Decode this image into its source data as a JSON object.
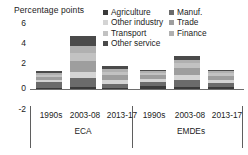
{
  "chart_data": {
    "type": "bar",
    "stacked": true,
    "title": "",
    "ylabel": "Percentage points",
    "xlabel": "",
    "ylim": [
      -2,
      6
    ],
    "yticks": [
      "6",
      "4",
      "2",
      "0",
      "-2"
    ],
    "ytick_values": [
      6,
      4,
      2,
      0,
      -2
    ],
    "grid": false,
    "legend_position": "top-right",
    "groups": [
      "ECA",
      "EMDEs"
    ],
    "categories": [
      "1990s",
      "2003-08",
      "2013-17",
      "1990s",
      "2003-08",
      "2013-17"
    ],
    "category_groups": [
      "ECA",
      "ECA",
      "ECA",
      "EMDEs",
      "EMDEs",
      "EMDEs"
    ],
    "series": [
      {
        "name": "Agriculture",
        "color": "#3a3a3a",
        "values": [
          0.12,
          0.18,
          0.1,
          0.22,
          0.2,
          0.16
        ]
      },
      {
        "name": "Manuf.",
        "color": "#6b6b6b",
        "values": [
          0.48,
          0.75,
          0.38,
          0.42,
          0.6,
          0.38
        ]
      },
      {
        "name": "Other industry",
        "color": "#d4d4d4",
        "values": [
          0.22,
          0.55,
          0.28,
          0.26,
          0.42,
          0.26
        ]
      },
      {
        "name": "Trade",
        "color": "#9e9e9e",
        "values": [
          0.26,
          0.92,
          0.42,
          0.3,
          0.62,
          0.36
        ]
      },
      {
        "name": "Transport",
        "color": "#c2c2c2",
        "values": [
          0.18,
          0.7,
          0.28,
          0.22,
          0.4,
          0.22
        ]
      },
      {
        "name": "Finance",
        "color": "#b0b0b0",
        "values": [
          0.14,
          0.68,
          0.26,
          0.16,
          0.3,
          0.18
        ]
      },
      {
        "name": "Other service",
        "color": "#4a4a4a",
        "values": [
          0.14,
          0.82,
          0.26,
          0.12,
          0.36,
          0.14
        ]
      }
    ],
    "totals": [
      1.54,
      4.6,
      1.98,
      1.7,
      2.9,
      1.7
    ]
  },
  "legend": {
    "items": [
      {
        "label": "Agriculture",
        "color": "#3a3a3a",
        "icon": "legend-swatch-agriculture"
      },
      {
        "label": "Manuf.",
        "color": "#6b6b6b",
        "icon": "legend-swatch-manufacturing"
      },
      {
        "label": "Other industry",
        "color": "#d4d4d4",
        "icon": "legend-swatch-other-industry"
      },
      {
        "label": "Trade",
        "color": "#9e9e9e",
        "icon": "legend-swatch-trade"
      },
      {
        "label": "Transport",
        "color": "#c2c2c2",
        "icon": "legend-swatch-transport"
      },
      {
        "label": "Finance",
        "color": "#b0b0b0",
        "icon": "legend-swatch-finance"
      },
      {
        "label": "Other service",
        "color": "#4a4a4a",
        "icon": "legend-swatch-other-service"
      }
    ]
  },
  "axis": {
    "unit_label": "Percentage points"
  }
}
